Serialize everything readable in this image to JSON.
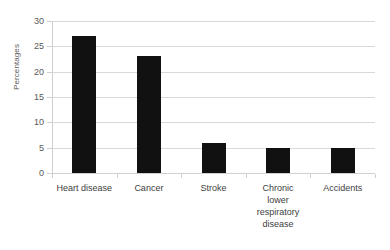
{
  "chart_data": {
    "type": "bar",
    "title": "",
    "subtitle": "",
    "xlabel": "",
    "ylabel": "Percentages",
    "categories": [
      "Heart disease",
      "Cancer",
      "Stroke",
      "Chronic lower respiratory disease",
      "Accidents"
    ],
    "category_lines": [
      [
        "Heart disease"
      ],
      [
        "Cancer"
      ],
      [
        "Stroke"
      ],
      [
        "Chronic",
        "lower",
        "respiratory",
        "disease"
      ],
      [
        "Accidents"
      ]
    ],
    "values": [
      27,
      23,
      6,
      5,
      5
    ],
    "ylim": [
      0,
      30
    ],
    "ytick_labels": [
      "0",
      "5",
      "10",
      "15",
      "20",
      "25",
      "30"
    ],
    "ytick_values": [
      0,
      5,
      10,
      15,
      20,
      25,
      30
    ],
    "grid": true,
    "legend": false,
    "legend_position": "none",
    "colors": {
      "bar": "#111111",
      "gridline": "#d9d9d9",
      "axis": "#cfcfcf",
      "tick_text": "#595959",
      "category_text": "#404040",
      "background": "#ffffff"
    }
  }
}
